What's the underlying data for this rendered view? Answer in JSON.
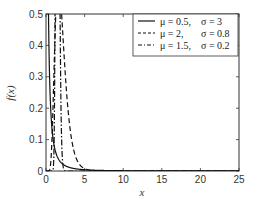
{
  "chart_data": {
    "type": "line",
    "title": "",
    "xlabel": "x",
    "ylabel": "f(x)",
    "xlim": [
      0,
      25
    ],
    "ylim": [
      0,
      0.5
    ],
    "xticks": [
      0,
      5,
      10,
      15,
      20,
      25
    ],
    "yticks": [
      0,
      0.1,
      0.2,
      0.3,
      0.4,
      0.5
    ],
    "xtick_labels": [
      "0",
      "5",
      "10",
      "15",
      "20",
      "25"
    ],
    "ytick_labels": [
      "0",
      "0.1",
      "0.2",
      "0.3",
      "0.4",
      "0.5"
    ],
    "grid": false,
    "legend_position": "upper right",
    "series": [
      {
        "name": "μ = 0.5, σ = 3",
        "mu_label": "μ  = 0.5,",
        "sigma_label": "σ  = 3",
        "style": "solid",
        "dist": "lognormal",
        "mean": 0.5,
        "sd": 3,
        "x": [
          0.1,
          0.5,
          1,
          2,
          3,
          5,
          7,
          10,
          15,
          20,
          25
        ],
        "values": [
          0.5,
          0.5,
          0.27,
          0.13,
          0.08,
          0.042,
          0.025,
          0.013,
          0.006,
          0.003,
          0.002
        ]
      },
      {
        "name": "μ = 2, σ = 0.8",
        "mu_label": "μ  = 2,",
        "sigma_label": "σ  = 0.8",
        "style": "dashed",
        "dist": "lognormal",
        "mean": 2,
        "sd": 0.8,
        "x": [
          0.5,
          1,
          2,
          3,
          4,
          5,
          7,
          10,
          15,
          20,
          25
        ],
        "values": [
          0.002,
          0.02,
          0.065,
          0.088,
          0.093,
          0.088,
          0.07,
          0.045,
          0.02,
          0.009,
          0.004
        ]
      },
      {
        "name": "μ = 1.5, σ = 0.2",
        "mu_label": "μ  = 1.5,",
        "sigma_label": "σ  = 0.2",
        "style": "dashdot",
        "dist": "lognormal",
        "mean": 1.5,
        "sd": 0.2,
        "x": [
          2,
          2.5,
          3,
          3.5,
          4,
          4.5,
          5,
          5.5,
          6,
          7,
          8,
          10
        ],
        "values": [
          0.0,
          0.02,
          0.13,
          0.31,
          0.44,
          0.45,
          0.37,
          0.25,
          0.15,
          0.04,
          0.008,
          0.0
        ]
      }
    ]
  }
}
